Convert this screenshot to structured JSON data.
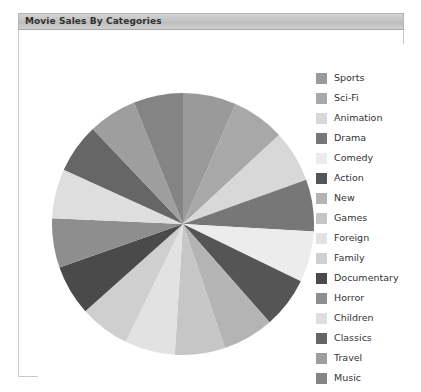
{
  "panel": {
    "title": "Movie Sales By Categories"
  },
  "chart_data": {
    "type": "pie",
    "title": "Movie Sales By Categories",
    "xlabel": "",
    "ylabel": "",
    "legend_position": "right",
    "grid": false,
    "start_angle_deg": 0,
    "direction": "clockwise",
    "categories": [
      "Sports",
      "Sci-Fi",
      "Animation",
      "Drama",
      "Comedy",
      "Action",
      "New",
      "Games",
      "Foreign",
      "Family",
      "Documentary",
      "Horror",
      "Children",
      "Classics",
      "Travel",
      "Music"
    ],
    "values": [
      6.6,
      6.5,
      6.4,
      6.4,
      6.3,
      6.3,
      6.3,
      6.2,
      6.2,
      6.2,
      6.2,
      6.1,
      6.1,
      6.1,
      6.0,
      6.1
    ],
    "unit": "percent",
    "colors": [
      "#9a9a9a",
      "#a8a8a8",
      "#d8d8d8",
      "#777777",
      "#ececec",
      "#555555",
      "#b4b4b4",
      "#c6c6c6",
      "#e2e2e2",
      "#cfcfcf",
      "#4a4a4a",
      "#8e8e8e",
      "#dedede",
      "#666666",
      "#9e9e9e",
      "#848484"
    ]
  }
}
